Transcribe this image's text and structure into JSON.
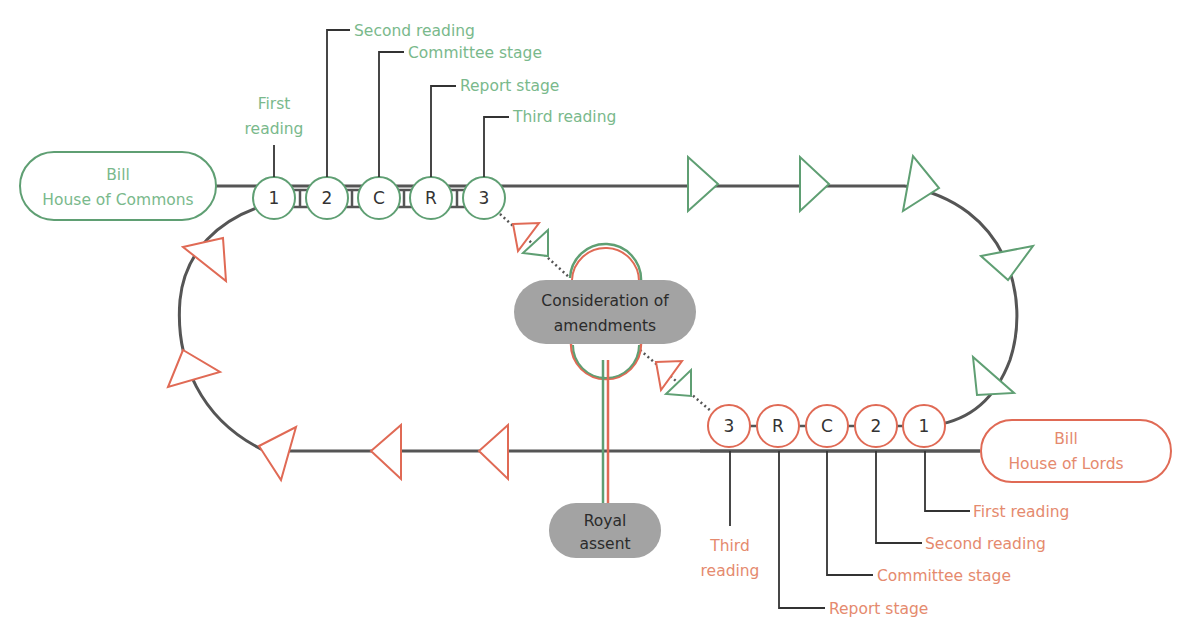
{
  "diagram": {
    "type": "legislative-process-flow",
    "colors": {
      "commons": "#5f9f73",
      "commons_text": "#7ab98c",
      "lords": "#e06a55",
      "lords_text": "#e58a6e",
      "line": "#555555",
      "pill": "#a3a3a3"
    },
    "commons": {
      "start_box": {
        "line1": "Bill",
        "line2": "House of Commons"
      },
      "stages": [
        {
          "symbol": "1",
          "label": "First reading",
          "label_line1": "First",
          "label_line2": "reading"
        },
        {
          "symbol": "2",
          "label": "Second reading"
        },
        {
          "symbol": "C",
          "label": "Committee stage"
        },
        {
          "symbol": "R",
          "label": "Report stage"
        },
        {
          "symbol": "3",
          "label": "Third reading"
        }
      ]
    },
    "lords": {
      "start_box": {
        "line1": "Bill",
        "line2": "House of Lords"
      },
      "stages": [
        {
          "symbol": "1",
          "label": "First reading"
        },
        {
          "symbol": "2",
          "label": "Second reading"
        },
        {
          "symbol": "C",
          "label": "Committee stage"
        },
        {
          "symbol": "R",
          "label": "Report stage"
        },
        {
          "symbol": "3",
          "label": "Third reading",
          "label_line1": "Third",
          "label_line2": "reading"
        }
      ]
    },
    "consideration": {
      "line1": "Consideration of",
      "line2": "amendments"
    },
    "royal_assent": {
      "line1": "Royal",
      "line2": "assent"
    }
  }
}
